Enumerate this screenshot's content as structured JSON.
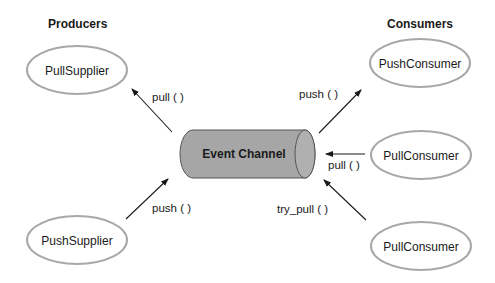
{
  "headers": {
    "producers": "Producers",
    "consumers": "Consumers"
  },
  "channel": {
    "label": "Event Channel",
    "fill_color": "#a6a6a6",
    "stroke_color": "#555555"
  },
  "nodes": {
    "pull_supplier": "PullSupplier",
    "push_supplier": "PushSupplier",
    "push_consumer": "PushConsumer",
    "pull_consumer_1": "PullConsumer",
    "pull_consumer_2": "PullConsumer"
  },
  "edges": {
    "pull_supplier": "pull ( )",
    "push_supplier": "push ( )",
    "push_consumer": "push ( )",
    "pull_consumer_1": "pull ( )",
    "pull_consumer_2": "try_pull ( )"
  },
  "colors": {
    "ellipse_border": "#a8a8a8",
    "text": "#1a1a1a"
  }
}
